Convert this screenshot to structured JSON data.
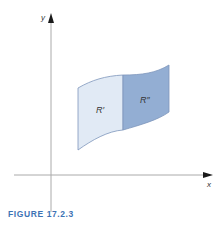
{
  "figure": {
    "caption": "FIGURE 17.2.3",
    "axes": {
      "x_label": "x",
      "y_label": "y"
    },
    "regions": [
      {
        "id": "R1",
        "label": "R′",
        "fill": "#e1eaf5"
      },
      {
        "id": "R2",
        "label": "R″",
        "fill": "#93aed3"
      }
    ],
    "colors": {
      "axis": "#aaaaaa",
      "arrow": "#1a1a1a",
      "outline": "#7d95bb",
      "caption": "#3d73b5"
    }
  }
}
